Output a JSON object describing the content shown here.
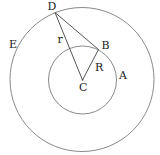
{
  "diagram": {
    "title": "",
    "outer_circle": {
      "cx": 82,
      "cy": 79.5,
      "r": 72,
      "label": "E"
    },
    "inner_circle": {
      "cx": 82.5,
      "cy": 80,
      "r": 34,
      "label": "A"
    },
    "points": {
      "C": {
        "x": 82.5,
        "y": 80,
        "label": "C"
      },
      "D": {
        "x": 55,
        "y": 12.5,
        "label": "D"
      },
      "B": {
        "x": 98.5,
        "y": 49.5,
        "label": "B"
      }
    },
    "segments": [
      {
        "from": "D",
        "to": "C",
        "label": "r"
      },
      {
        "from": "D",
        "to": "B",
        "label": ""
      },
      {
        "from": "C",
        "to": "B",
        "label": "R"
      }
    ],
    "labels": {
      "D": "D",
      "E": "E",
      "B": "B",
      "r": "r",
      "R": "R",
      "A": "A",
      "C": "C"
    },
    "colors": {
      "circle_stroke": "#8a8a8a",
      "line_stroke": "#555555",
      "text": "#222222"
    }
  }
}
